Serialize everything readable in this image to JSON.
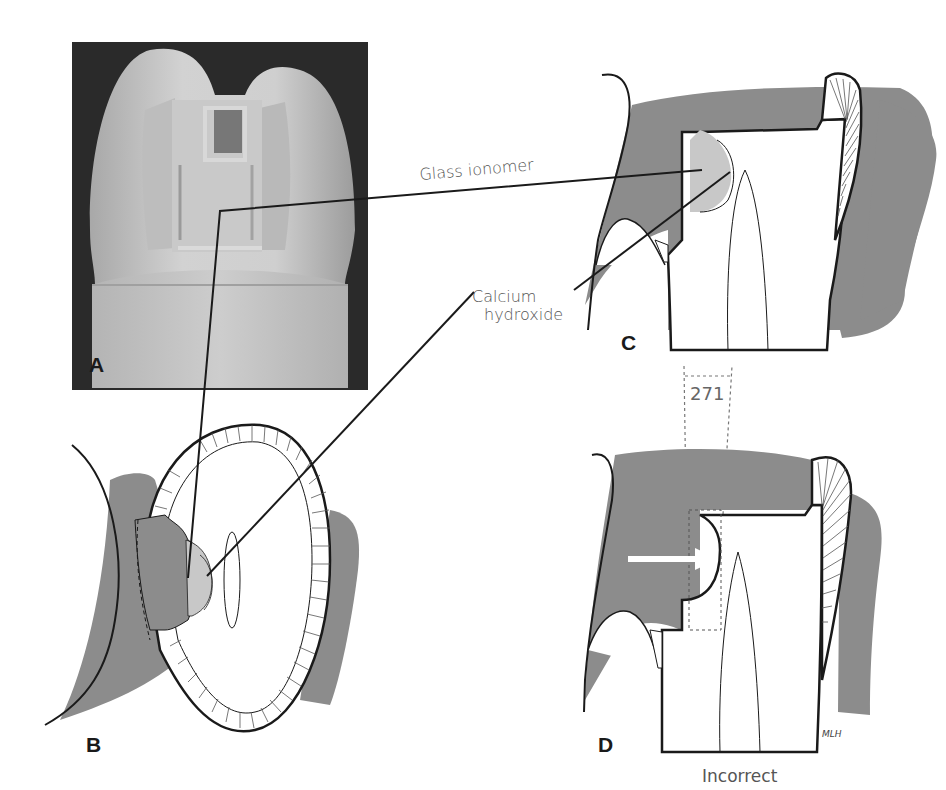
{
  "figure": {
    "panels": {
      "A": {
        "letter": "A",
        "kind": "photograph",
        "subject": "tooth model with proximal box preparation"
      },
      "B": {
        "letter": "B",
        "kind": "occlusal cross-section drawing"
      },
      "C": {
        "letter": "C",
        "kind": "proximal section drawing"
      },
      "D": {
        "letter": "D",
        "kind": "proximal section drawing",
        "caption": "Incorrect"
      }
    },
    "labels": {
      "glass_ionomer": "Glass ionomer",
      "calcium_hydroxide_line1": "Calcium",
      "calcium_hydroxide_line2": "hydroxide"
    },
    "bur_number": "271",
    "signature": "MLH",
    "colors": {
      "tooth_gray": "#8c8c8c",
      "liner_light_gray": "#c8c8c8",
      "photo_dark": "#2a2a2a",
      "photo_tooth": "#c4c4c4",
      "outline": "#1a1a1a",
      "arrow": "#ffffff"
    }
  }
}
